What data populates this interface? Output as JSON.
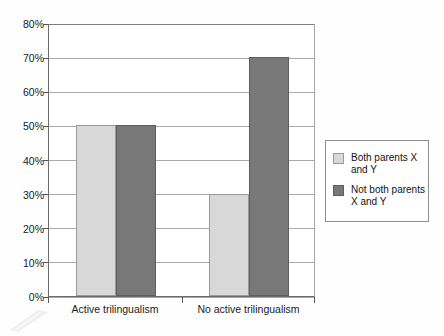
{
  "chart_data": {
    "type": "bar",
    "title": "",
    "subtitle": "",
    "xlabel": "",
    "ylabel": "",
    "categories": [
      "Active trilingualism",
      "No active trilingualism"
    ],
    "series": [
      {
        "name": "Both parents X and Y",
        "values": [
          50,
          70
        ]
      },
      {
        "name": "Not both parents X and Y",
        "values": [
          50,
          30
        ]
      }
    ],
    "series_display": [
      {
        "name": "Both parents X and Y",
        "color": "#d8d8d8",
        "values": [
          50,
          30
        ]
      },
      {
        "name": "Not both parents X and Y",
        "color": "#787878",
        "values": [
          50,
          70
        ]
      }
    ],
    "ylim": [
      0,
      80
    ],
    "ytick_step": 10,
    "ytick_labels": [
      "0%",
      "10%",
      "20%",
      "30%",
      "40%",
      "50%",
      "60%",
      "70%",
      "80%"
    ],
    "ytick_values": [
      0,
      10,
      20,
      30,
      40,
      50,
      60,
      70,
      80
    ],
    "value_format": "percent",
    "grid": true,
    "grid_axis": "y",
    "legend_position": "right"
  },
  "axis": {
    "y_labels": [
      "80%",
      "70%",
      "60%",
      "50%",
      "40%",
      "30%",
      "20%",
      "10%",
      "0%"
    ],
    "x_labels": [
      "Active trilingualism",
      "No active trilingualism"
    ]
  },
  "bars": [
    {
      "group": "Active trilingualism",
      "series": "Both parents X and Y",
      "value": 50,
      "label": "50%",
      "color": "#d8d8d8"
    },
    {
      "group": "Active trilingualism",
      "series": "Not both parents X and Y",
      "value": 50,
      "label": "50%",
      "color": "#787878"
    },
    {
      "group": "No active trilingualism",
      "series": "Both parents X and Y",
      "value": 30,
      "label": "30%",
      "color": "#d8d8d8"
    },
    {
      "group": "No active trilingualism",
      "series": "Not both parents X and Y",
      "value": 70,
      "label": "70%",
      "color": "#787878"
    }
  ],
  "legend": {
    "items": [
      {
        "label": "Both parents X and Y",
        "color": "#d8d8d8"
      },
      {
        "label": "Not both parents X and Y",
        "color": "#787878"
      }
    ]
  },
  "colors": {
    "light_bar": "#d8d8d8",
    "dark_bar": "#787878",
    "gridline": "#a9a9a9",
    "axis": "#6b6b6b",
    "text": "#1b1b1b",
    "background": "#ffffff"
  }
}
